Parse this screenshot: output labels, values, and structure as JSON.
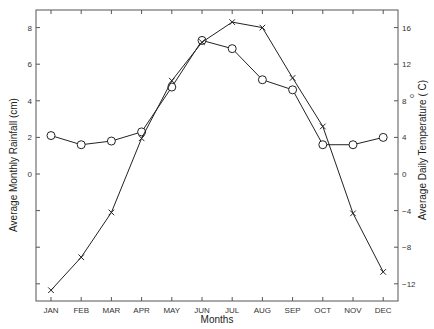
{
  "chart_data": {
    "type": "line",
    "title": "",
    "xlabel": "Months",
    "ylabel": "Average Monthly Rainfall (cm)",
    "y2label": "Average Daily Temperature (°C)",
    "categories": [
      "JAN",
      "FEB",
      "MAR",
      "APR",
      "MAY",
      "JUN",
      "JUL",
      "AUG",
      "SEP",
      "OCT",
      "NOV",
      "DEC"
    ],
    "series": [
      {
        "name": "Average Monthly Rainfall (cm)",
        "axis": "left",
        "marker": "circle",
        "values": [
          2.1,
          1.6,
          1.8,
          2.3,
          4.75,
          7.3,
          6.85,
          5.15,
          4.6,
          1.6,
          1.6,
          2.0
        ]
      },
      {
        "name": "Average Daily Temperature (°C)",
        "axis": "right",
        "marker": "x",
        "values": [
          -12.7,
          -9.1,
          -4.2,
          3.9,
          10.2,
          14.4,
          16.6,
          16.0,
          10.5,
          5.2,
          -4.3,
          -10.7
        ]
      }
    ],
    "left_axis": {
      "ticks": [
        8,
        6,
        4,
        2,
        0
      ],
      "tick_labels": [
        "8",
        "6",
        "4",
        "2",
        "0"
      ],
      "unlabeled_ticks_below_zero": 3
    },
    "right_axis": {
      "ticks": [
        16,
        12,
        8,
        4,
        0,
        -4,
        -8,
        -12
      ],
      "tick_labels": [
        "16",
        "12",
        "8",
        "4",
        "0",
        "−4",
        "−8",
        "−12"
      ]
    },
    "ylim": [
      -6.8,
      9
    ],
    "y2lim": [
      -13.6,
      18
    ],
    "grid": false,
    "legend": "none"
  },
  "labels": {
    "xlabel": "Months",
    "ylabel": "Average Monthly Rainfall (cm)",
    "y2label_main": "Average Daily Temperature ( C)",
    "y2label_degree": "o"
  }
}
